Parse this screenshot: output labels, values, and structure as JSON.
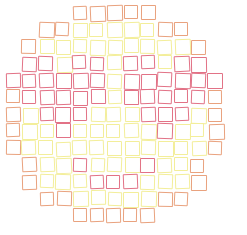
{
  "figure": {
    "grid": {
      "origin_x": 13,
      "origin_y": 13,
      "pitch": 16.9,
      "cell_size": 15,
      "columns": 13,
      "rows": 13
    },
    "palette": {
      "Y": "#f3ee9a",
      "O": "#e9a27e",
      "R": "#e27286"
    },
    "rows": [
      "....OOOOO....",
      "..OOYYYYYOO..",
      ".OYYYYYYYYYO.",
      ".RRYRRYRRYRR.",
      "RRRRRRYRRRRRR",
      "ORRRRRYRRRRRO",
      "OYRRRYYYRRRYO",
      "OYYRYYYYYRYYO",
      "OYYYYYYYYYYYO",
      ".OYYRYYYRYYO.",
      ".OYYYRRRYYYO.",
      "..OOYYYYYOO..",
      "....OOOOO...."
    ]
  }
}
